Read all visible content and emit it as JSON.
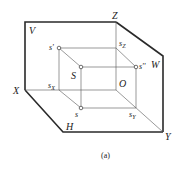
{
  "figure": {
    "caption": "(a)",
    "planes": {
      "V": "V",
      "W": "W",
      "H": "H"
    },
    "axes": {
      "X": "X",
      "Y": "Y",
      "Z": "Z",
      "O": "O"
    },
    "points": {
      "S": "S",
      "s_front": "s'",
      "s_side": "s''",
      "s_top": "s",
      "sX_base": "s",
      "sX_sub": "X",
      "sY_base": "s",
      "sY_sub": "Y",
      "sZ_base": "s",
      "sZ_sub": "Z"
    }
  }
}
